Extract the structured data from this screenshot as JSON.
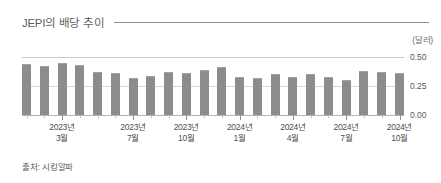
{
  "header": {
    "title": "JEPI의 배당 추이"
  },
  "footer": {
    "source": "출처: 시킹알파"
  },
  "chart_data": {
    "type": "bar",
    "title": "JEPI의 배당 추이",
    "unit_label": "(달러)",
    "xlabel": "",
    "ylabel": "",
    "ylim": [
      0,
      0.5
    ],
    "yticks": [
      "0.00",
      "0.25",
      "0.50"
    ],
    "ytick_values": [
      0.0,
      0.25,
      0.5
    ],
    "grid": true,
    "legend": null,
    "bar_color": "#8c8c8c",
    "categories": [
      "2023년 1월",
      "2023년 2월",
      "2023년 3월",
      "2023년 4월",
      "2023년 5월",
      "2023년 6월",
      "2023년 7월",
      "2023년 8월",
      "2023년 9월",
      "2023년 10월",
      "2023년 11월",
      "2023년 12월",
      "2024년 1월",
      "2024년 2월",
      "2024년 3월",
      "2024년 4월",
      "2024년 5월",
      "2024년 6월",
      "2024년 7월",
      "2024년 8월",
      "2024년 9월",
      "2024년 10월"
    ],
    "values": [
      0.44,
      0.42,
      0.45,
      0.43,
      0.37,
      0.36,
      0.32,
      0.34,
      0.37,
      0.36,
      0.39,
      0.41,
      0.33,
      0.32,
      0.35,
      0.33,
      0.35,
      0.33,
      0.3,
      0.38,
      0.37,
      0.36
    ],
    "xtick_labels": [
      {
        "line1": "2023년",
        "line2": "3월",
        "index": 2
      },
      {
        "line1": "2023년",
        "line2": "7월",
        "index": 6
      },
      {
        "line1": "2023년",
        "line2": "10월",
        "index": 9
      },
      {
        "line1": "2024년",
        "line2": "1월",
        "index": 12
      },
      {
        "line1": "2024년",
        "line2": "4월",
        "index": 15
      },
      {
        "line1": "2024년",
        "line2": "7월",
        "index": 18
      },
      {
        "line1": "2024년",
        "line2": "10월",
        "index": 21
      }
    ]
  }
}
